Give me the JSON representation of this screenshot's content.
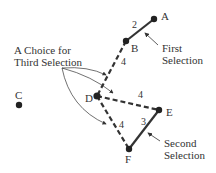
{
  "diagram": {
    "nodes": [
      {
        "id": "A",
        "label": "A",
        "x": 154,
        "y": 19
      },
      {
        "id": "B",
        "label": "B",
        "x": 126,
        "y": 41
      },
      {
        "id": "C",
        "label": "C",
        "x": 19,
        "y": 105
      },
      {
        "id": "D",
        "label": "D",
        "x": 97,
        "y": 96
      },
      {
        "id": "E",
        "label": "E",
        "x": 159,
        "y": 110
      },
      {
        "id": "F",
        "label": "F",
        "x": 129,
        "y": 149
      }
    ],
    "edges": [
      {
        "from": "A",
        "to": "B",
        "weight": "2",
        "style": "solid"
      },
      {
        "from": "B",
        "to": "D",
        "weight": "4",
        "style": "dashed"
      },
      {
        "from": "D",
        "to": "E",
        "weight": "4",
        "style": "dashed"
      },
      {
        "from": "E",
        "to": "F",
        "weight": "3",
        "style": "solid"
      },
      {
        "from": "D",
        "to": "F",
        "weight": "4",
        "style": "dashed"
      }
    ],
    "annotations": {
      "first_selection": [
        "First",
        "Selection"
      ],
      "second_selection": [
        "Second",
        "Selection"
      ],
      "third_choice": [
        "A Choice for",
        "Third Selection"
      ]
    },
    "colors": {
      "ink": "#333333",
      "background": "#ffffff"
    }
  }
}
